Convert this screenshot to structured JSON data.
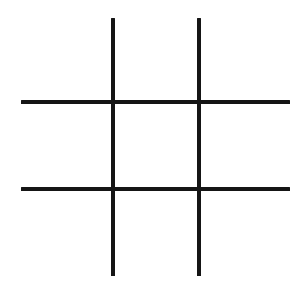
{
  "image": {
    "title": "Tic-Tac-Toe Grid",
    "description": "Empty tic-tac-toe (noughts and crosses) board drawn as four black lines on a white background",
    "width": 305,
    "height": 293,
    "background_color": "#ffffff",
    "ink_color": "#151515"
  },
  "board": {
    "type": "tic-tac-toe",
    "rows": 3,
    "columns": 3,
    "state": "empty",
    "marks": [
      [
        "",
        "",
        ""
      ],
      [
        "",
        "",
        ""
      ],
      [
        "",
        "",
        ""
      ]
    ]
  },
  "lines": [
    {
      "name": "vertical-line-left",
      "orientation": "vertical",
      "x": 111,
      "y": 18,
      "length": 258,
      "thickness": 4,
      "color": "#151515"
    },
    {
      "name": "vertical-line-right",
      "orientation": "vertical",
      "x": 197,
      "y": 18,
      "length": 258,
      "thickness": 4,
      "color": "#151515"
    },
    {
      "name": "horizontal-line-top",
      "orientation": "horizontal",
      "x": 21,
      "y": 100,
      "length": 269,
      "thickness": 4,
      "color": "#151515"
    },
    {
      "name": "horizontal-line-bottom",
      "orientation": "horizontal",
      "x": 21,
      "y": 187,
      "length": 269,
      "thickness": 4,
      "color": "#151515"
    }
  ],
  "cells": [
    {
      "name": "cell-top-left",
      "row": 0,
      "col": 0,
      "mark": "",
      "x": 21,
      "y": 18,
      "width": 90,
      "height": 82
    },
    {
      "name": "cell-top-center",
      "row": 0,
      "col": 1,
      "mark": "",
      "x": 115,
      "y": 18,
      "width": 82,
      "height": 82
    },
    {
      "name": "cell-top-right",
      "row": 0,
      "col": 2,
      "mark": "",
      "x": 201,
      "y": 18,
      "width": 89,
      "height": 82
    },
    {
      "name": "cell-middle-left",
      "row": 1,
      "col": 0,
      "mark": "",
      "x": 21,
      "y": 104,
      "width": 90,
      "height": 83
    },
    {
      "name": "cell-middle-center",
      "row": 1,
      "col": 1,
      "mark": "",
      "x": 115,
      "y": 104,
      "width": 82,
      "height": 83
    },
    {
      "name": "cell-middle-right",
      "row": 1,
      "col": 2,
      "mark": "",
      "x": 201,
      "y": 104,
      "width": 89,
      "height": 83
    },
    {
      "name": "cell-bottom-left",
      "row": 2,
      "col": 0,
      "mark": "",
      "x": 21,
      "y": 191,
      "width": 90,
      "height": 85
    },
    {
      "name": "cell-bottom-center",
      "row": 2,
      "col": 1,
      "mark": "",
      "x": 115,
      "y": 191,
      "width": 82,
      "height": 85
    },
    {
      "name": "cell-bottom-right",
      "row": 2,
      "col": 2,
      "mark": "",
      "x": 201,
      "y": 191,
      "width": 89,
      "height": 85
    }
  ]
}
